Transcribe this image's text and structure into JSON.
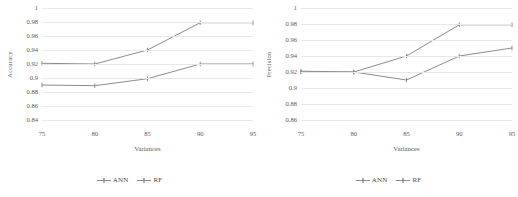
{
  "figure": {
    "panels": [
      {
        "id": "accuracy-panel",
        "axis_title_y": "Accuracy",
        "axis_title_x": "Variances",
        "ytick_labels": [
          "1",
          "0.98",
          "0.96",
          "0.94",
          "0.92",
          "0.9",
          "0.88",
          "0.86",
          "0.84"
        ],
        "xtick_labels": [
          "75",
          "80",
          "85",
          "90",
          "95"
        ],
        "legend": [
          {
            "label": "ANN",
            "color": "#8c8c8c"
          },
          {
            "label": "RF",
            "color": "#8c8c8c"
          }
        ],
        "chart_data": {
          "type": "line",
          "title": "",
          "xlabel": "Variances",
          "ylabel": "Accuracy",
          "x": [
            75,
            80,
            85,
            90,
            95
          ],
          "xlim": [
            75,
            95
          ],
          "ylim": [
            0.84,
            1.0
          ],
          "ytick_values": [
            1,
            0.98,
            0.96,
            0.94,
            0.92,
            0.9,
            0.88,
            0.86,
            0.84
          ],
          "grid": true,
          "legend_position": "bottom-center",
          "series": [
            {
              "name": "ANN",
              "values": [
                0.89,
                0.889,
                0.899,
                0.92,
                0.92
              ],
              "color": "#8c8c8c"
            },
            {
              "name": "RF",
              "values": [
                0.921,
                0.92,
                0.94,
                0.979,
                0.979
              ],
              "color": "#8c8c8c"
            }
          ]
        }
      },
      {
        "id": "precision-panel",
        "axis_title_y": "Precision",
        "axis_title_x": "Variances",
        "ytick_labels": [
          "1",
          "0.98",
          "0.96",
          "0.94",
          "0.92",
          "0.9",
          "0.88",
          "0.86"
        ],
        "xtick_labels": [
          "75",
          "80",
          "85",
          "90",
          "95"
        ],
        "legend": [
          {
            "label": "ANN",
            "color": "#8c8c8c"
          },
          {
            "label": "RF",
            "color": "#8c8c8c"
          }
        ],
        "chart_data": {
          "type": "line",
          "title": "",
          "xlabel": "Variances",
          "ylabel": "Precision",
          "x": [
            75,
            80,
            85,
            90,
            95
          ],
          "xlim": [
            75,
            95
          ],
          "ylim": [
            0.86,
            1.0
          ],
          "ytick_values": [
            1,
            0.98,
            0.96,
            0.94,
            0.92,
            0.9,
            0.88,
            0.86
          ],
          "grid": true,
          "legend_position": "bottom-center",
          "series": [
            {
              "name": "ANN",
              "values": [
                0.92,
                0.92,
                0.91,
                0.94,
                0.95
              ],
              "color": "#8c8c8c"
            },
            {
              "name": "RF",
              "values": [
                0.921,
                0.92,
                0.94,
                0.979,
                0.979
              ],
              "color": "#8c8c8c"
            }
          ]
        }
      }
    ]
  }
}
